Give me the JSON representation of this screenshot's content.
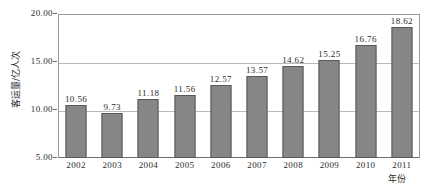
{
  "chart_data": {
    "type": "bar",
    "title": "",
    "subtitle": "",
    "xlabel": "年份",
    "ylabel": "客运量/亿人次",
    "categories": [
      "2002",
      "2003",
      "2004",
      "2005",
      "2006",
      "2007",
      "2008",
      "2009",
      "2010",
      "2011"
    ],
    "values": [
      10.56,
      9.73,
      11.18,
      11.56,
      12.57,
      13.57,
      14.62,
      15.25,
      16.76,
      18.62
    ],
    "value_labels": [
      "10.56",
      "9.73",
      "11.18",
      "11.56",
      "12.57",
      "13.57",
      "14.62",
      "15.25",
      "16.76",
      "18.62"
    ],
    "ylim": [
      5.0,
      20.0
    ],
    "y_ticks": [
      5.0,
      10.0,
      15.0,
      20.0
    ],
    "y_tick_labels": [
      "5.00",
      "10.00",
      "15.00",
      "20.00"
    ],
    "grid": true,
    "grid_axis": "y",
    "legend": false,
    "legend_position": "none",
    "bar_color": "#868686",
    "bar_border_color": "#595959",
    "gridline_color": "#b9b9b9",
    "axis_color": "#6e6e6e",
    "background_color": "#ffffff",
    "text_color": "#2b2b2b"
  }
}
